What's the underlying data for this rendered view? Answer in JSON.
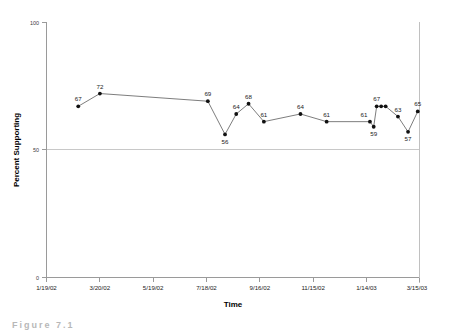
{
  "figure": {
    "caption": "Figure 7.1"
  },
  "chart_data": {
    "type": "line",
    "title": "",
    "xlabel": "Time",
    "ylabel": "Percent Supporting",
    "ylim": [
      0,
      100
    ],
    "yticks": [
      0,
      50,
      100
    ],
    "ytick_labels": [
      "0",
      "50",
      "100"
    ],
    "grid": false,
    "reference_line_y": 50,
    "legend": "none",
    "xtick_labels": [
      "1/19/02",
      "3/20/02",
      "5/19/02",
      "7/18/02",
      "9/16/02",
      "11/15/02",
      "1/14/03",
      "3/15/03"
    ],
    "x": [
      "2/15/02",
      "3/12/02",
      "8/05/02",
      "8/26/02",
      "9/07/02",
      "9/18/02",
      "10/01/02",
      "11/10/02",
      "12/08/02",
      "1/26/03",
      "1/28/03",
      "2/01/03",
      "2/05/03",
      "2/09/03",
      "2/20/03",
      "3/02/03",
      "3/12/03"
    ],
    "values": [
      67,
      72,
      69,
      56,
      64,
      68,
      61,
      64,
      61,
      61,
      59,
      67,
      67,
      67,
      63,
      57,
      65
    ],
    "point_labels": [
      "67",
      "72",
      "69",
      "56",
      "64",
      "68",
      "61",
      "64",
      "61",
      "61",
      "59",
      "67",
      "",
      "",
      "63",
      "57",
      "65"
    ],
    "series": [
      {
        "name": "Percent Supporting",
        "values": [
          67,
          72,
          69,
          56,
          64,
          68,
          61,
          64,
          61,
          61,
          59,
          67,
          67,
          67,
          63,
          57,
          65
        ]
      }
    ],
    "colors": {
      "line": "#6e6e6e",
      "marker": "#111111",
      "axis": "#9a9a9a",
      "reference": "#c8c8c8"
    }
  }
}
